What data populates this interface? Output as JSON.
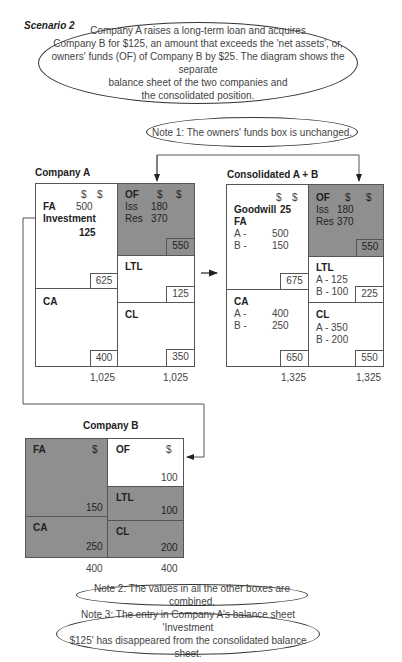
{
  "scenario_title": "Scenario 2",
  "intro_text": "Company A raises a long-term loan and acquires Company B for $125, an amount that exceeds the 'net assets', or, owners' funds (OF) of Company B by $25. The diagram shows the separate balance sheet of the two companies and the consolidated position.",
  "intro_lines": [
    "Company A raises a long-term loan and acquires",
    "Company B for $125, an amount that exceeds the 'net assets', or,",
    "owners' funds (OF) of Company B by $25. The diagram shows the separate",
    "balance sheet of the two companies and",
    "the consolidated position."
  ],
  "notes": {
    "note1": "Note 1: The owners' funds box is unchanged.",
    "note2": "Note 2: The values in all the other boxes are combined.",
    "note3_lines": [
      "Note 3: The entry in Company A's balance sheet 'Investment",
      "$125' has disappeared from the consolidated balance sheet."
    ]
  },
  "company_a": {
    "title": "Company A",
    "fa": {
      "label": "FA",
      "cur1": "$",
      "cur2": "$",
      "value": "500",
      "investment_label": "Investment",
      "investment_value": "125",
      "total": "625"
    },
    "ca": {
      "label": "CA",
      "total": "400"
    },
    "of": {
      "label": "OF",
      "cur1": "$",
      "cur2": "$",
      "iss_label": "Iss",
      "iss": "180",
      "res_label": "Res",
      "res": "370",
      "total": "550"
    },
    "ltl": {
      "label": "LTL",
      "total": "125"
    },
    "cl": {
      "label": "CL",
      "total": "350"
    },
    "left_total": "1,025",
    "right_total": "1,025"
  },
  "consolidated": {
    "title": "Consolidated A + B",
    "fa": {
      "cur1": "$",
      "cur2": "$",
      "goodwill_label": "Goodwill",
      "goodwill": "25",
      "label": "FA",
      "a_label": "A -",
      "a": "500",
      "b_label": "B -",
      "b": "150",
      "total": "675"
    },
    "ca": {
      "label": "CA",
      "a_label": "A -",
      "a": "400",
      "b_label": "B -",
      "b": "250",
      "total": "650"
    },
    "of": {
      "label": "OF",
      "cur1": "$",
      "cur2": "$",
      "iss_label": "Iss",
      "iss": "180",
      "res_label": "Res",
      "res": "370",
      "total": "550"
    },
    "ltl": {
      "label": "LTL",
      "a": "A - 125",
      "b": "B - 100",
      "total": "225"
    },
    "cl": {
      "label": "CL",
      "a": "A - 350",
      "b": "B - 200",
      "total": "550"
    },
    "left_total": "1,325",
    "right_total": "1,325"
  },
  "company_b": {
    "title": "Company B",
    "fa": {
      "label": "FA",
      "cur": "$",
      "total": "150"
    },
    "ca": {
      "label": "CA",
      "total": "250"
    },
    "of": {
      "label": "OF",
      "cur": "$",
      "total": "100"
    },
    "ltl": {
      "label": "LTL",
      "total": "100"
    },
    "cl": {
      "label": "CL",
      "total": "200"
    },
    "left_total": "400",
    "right_total": "400"
  },
  "colors": {
    "shade": "#8f8f8f",
    "line": "#555555",
    "text": "#444444"
  }
}
